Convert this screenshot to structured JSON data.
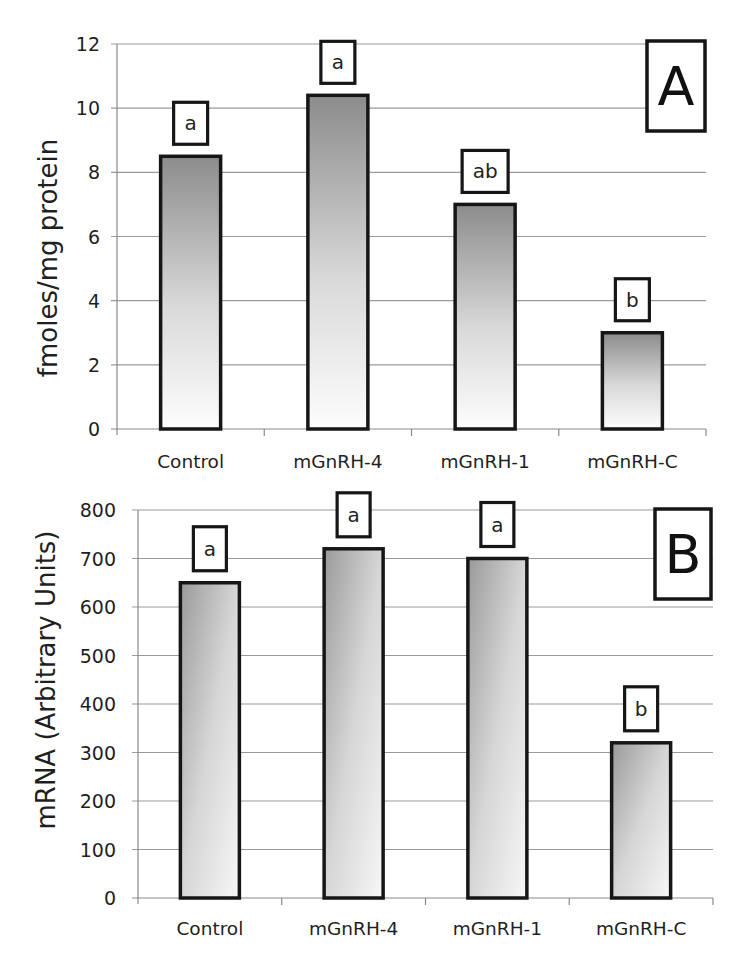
{
  "chart_data": [
    {
      "panel": "A",
      "type": "bar",
      "title": "",
      "xlabel": "",
      "ylabel": "fmoles/mg protein",
      "ylim": [
        0,
        12
      ],
      "yticks": [
        0,
        2,
        4,
        6,
        8,
        10,
        12
      ],
      "grid": true,
      "legend": null,
      "categories": [
        "Control",
        "mGnRH-4",
        "mGnRH-1",
        "mGnRH-C"
      ],
      "values": [
        8.5,
        10.4,
        7.0,
        3.0
      ],
      "significance_letters": [
        "a",
        "a",
        "ab",
        "b"
      ],
      "fill": "vertical gradient (dark grey top to white bottom)"
    },
    {
      "panel": "B",
      "type": "bar",
      "title": "",
      "xlabel": "",
      "ylabel": "mRNA (Arbitrary Units)",
      "ylim": [
        0,
        800
      ],
      "yticks": [
        0,
        100,
        200,
        300,
        400,
        500,
        600,
        700,
        800
      ],
      "grid": true,
      "legend": null,
      "categories": [
        "Control",
        "mGnRH-4",
        "mGnRH-1",
        "mGnRH-C"
      ],
      "values": [
        650,
        720,
        700,
        320
      ],
      "significance_letters": [
        "a",
        "a",
        "a",
        "b"
      ],
      "fill": "diagonal gradient (dark grey top-left to light bottom-right)"
    }
  ],
  "panels": {
    "A": {
      "label": "A"
    },
    "B": {
      "label": "B"
    }
  },
  "colors": {
    "bar_dark": "#8c8c8c",
    "bar_light": "#fbfbfb",
    "outline": "#161616",
    "grid": "#9a9a9a"
  }
}
